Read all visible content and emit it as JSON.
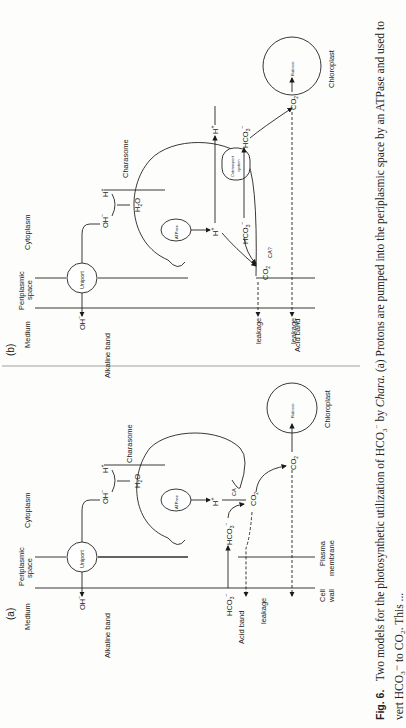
{
  "figure": {
    "label": "Fig. 6.",
    "caption_line1_prefix": "Two models for the photosynthetic utilization of HCO",
    "caption_line1_mid": " by ",
    "caption_organism": "Chara.",
    "caption_line1_suffix": " (a) Protons are pumped into the periplasmic space by an ATPase and used to",
    "caption_line2": "vert HCO₃⁻ to CO₂. This ..."
  },
  "panel_a": {
    "tag": "(a)",
    "regions": {
      "medium": "Medium",
      "periplasmic1": "Periplasmic",
      "periplasmic2": "space",
      "cytoplasm": "Cytoplasm"
    },
    "membranes": {
      "cell1": "Cell",
      "cell2": "wall",
      "plasma1": "Plasma",
      "plasma2": "membrane"
    },
    "bands": {
      "alkaline": "Alkaline band",
      "acid": "Acid band",
      "leakage": "leakage"
    },
    "components": {
      "uniport": "Uniport",
      "atpase": "ATPase",
      "charasome": "Charasome",
      "rubisco": "Rubisco",
      "chloroplast": "Chloroplast",
      "ca": "CA"
    },
    "species": {
      "oh": "OH",
      "h2o": "H",
      "h": "H",
      "hco3": "HCO",
      "co2": "CO"
    }
  },
  "panel_b": {
    "tag": "(b)",
    "regions": {
      "medium": "Medium",
      "periplasmic1": "Periplasmic",
      "periplasmic2": "space",
      "cytoplasm": "Cytoplasm"
    },
    "bands": {
      "alkaline": "Alkaline band",
      "acid": "Acid band",
      "leakage": "leakage"
    },
    "components": {
      "uniport": "Uniport",
      "atpase": "ATPase",
      "charasome": "Charasome",
      "cotransport1": "Cotransport",
      "cotransport2": "system",
      "rubisco": "Rubisco",
      "chloroplast": "Chloroplast",
      "ca": "CA?"
    },
    "species": {
      "oh": "OH",
      "h2o": "H",
      "h": "H",
      "hco3": "HCO",
      "co2": "CO"
    }
  }
}
